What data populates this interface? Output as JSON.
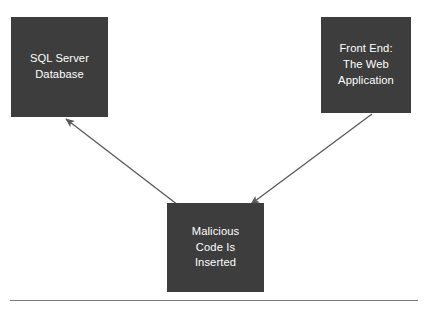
{
  "diagram": {
    "type": "flow-diagram",
    "background_color": "#ffffff",
    "node_fill_color": "#3d3d3d",
    "node_text_color": "#ffffff",
    "connector_color": "#595959",
    "rule_color": "#7a7a7a",
    "nodes": [
      {
        "id": "sql-server-database",
        "lines": [
          "SQL Server",
          "Database"
        ],
        "x": 11,
        "y": 17,
        "width": 97,
        "height": 100
      },
      {
        "id": "front-end-web-application",
        "lines": [
          "Front End:",
          "The Web",
          "Application"
        ],
        "x": 321,
        "y": 17,
        "width": 90,
        "height": 96
      },
      {
        "id": "malicious-code-is-inserted",
        "lines": [
          "Malicious",
          "Code Is",
          "Inserted"
        ],
        "x": 167,
        "y": 203,
        "width": 97,
        "height": 89
      }
    ],
    "connectors": [
      {
        "id": "malicious-to-database",
        "from": "malicious-code-is-inserted",
        "to": "sql-server-database",
        "x1": 178,
        "y1": 205,
        "x2": 66,
        "y2": 119,
        "arrowhead_at": "to"
      },
      {
        "id": "front-end-to-malicious",
        "from": "front-end-web-application",
        "to": "malicious-code-is-inserted",
        "x1": 372,
        "y1": 114,
        "x2": 251,
        "y2": 204,
        "arrowhead_at": "to"
      }
    ],
    "rule": {
      "x1": 10,
      "x2": 418,
      "y": 300
    }
  }
}
